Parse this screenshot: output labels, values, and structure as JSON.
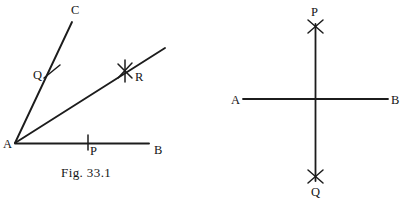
{
  "figure": {
    "caption": "Fig. 33.1",
    "background_color": "#ffffff",
    "ink_color": "#1c1c1c",
    "panels": [
      {
        "name": "angle-bisector-construction",
        "vertex_label": "A",
        "labels": {
          "A": "A",
          "B": "B",
          "C": "C",
          "P": "P",
          "Q": "Q",
          "R": "R"
        },
        "rays": [
          {
            "from": "A",
            "to": "B",
            "note": "horizontal base ray"
          },
          {
            "from": "A",
            "to": "C",
            "note": "upper ray"
          },
          {
            "from": "A",
            "to": "R",
            "note": "bisector ray through arc intersection"
          }
        ],
        "arc_marks": [
          {
            "at": "P",
            "on": "AB",
            "type": "tick"
          },
          {
            "at": "Q",
            "on": "AC",
            "type": "tick"
          },
          {
            "at": "R",
            "on": "AR",
            "type": "cross"
          }
        ]
      },
      {
        "name": "perpendicular-bisector-construction",
        "labels": {
          "A": "A",
          "B": "B",
          "P": "P",
          "Q": "Q"
        },
        "rays": [
          {
            "from": "A",
            "to": "B",
            "note": "horizontal line"
          },
          {
            "from": "P",
            "to": "Q",
            "note": "vertical perpendicular line"
          }
        ],
        "arc_marks": [
          {
            "at": "P",
            "type": "cross"
          },
          {
            "at": "Q",
            "type": "cross"
          }
        ]
      }
    ]
  }
}
